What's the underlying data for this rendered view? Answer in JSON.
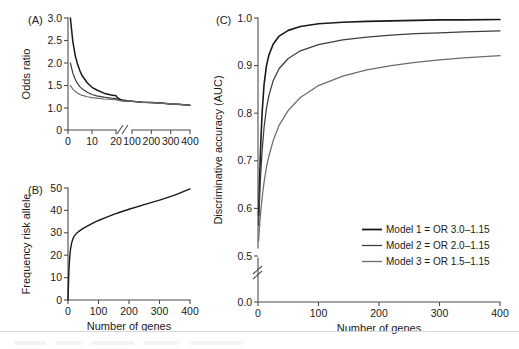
{
  "figure": {
    "panels": [
      "A",
      "B",
      "C"
    ],
    "shared_xlabel": "Number of genes"
  },
  "chart_data": [
    {
      "id": "panelA",
      "type": "line",
      "panel_letter": "(A)",
      "title": "",
      "xlabel": "Number of genes",
      "ylabel": "Odds ratio",
      "xlim": [
        0,
        400
      ],
      "ylim": [
        0,
        3.0
      ],
      "x_axis_break": true,
      "x_break_between": [
        20,
        100
      ],
      "y_axis_break": true,
      "y_break_between": [
        0,
        1.0
      ],
      "xticks": [
        0,
        10,
        20,
        100,
        200,
        300,
        400
      ],
      "xticklabels": [
        "0",
        "10",
        "20",
        "100",
        "200",
        "300",
        "400"
      ],
      "yticks": [
        0,
        1.0,
        1.5,
        2.0,
        2.5,
        3.0
      ],
      "yticklabels": [
        "0",
        "1.0",
        "1.5",
        "2.0",
        "2.5",
        "3.0"
      ],
      "grid": false,
      "legend": "none",
      "series": [
        {
          "name": "Model 1 = OR 3.0-1.15",
          "color": "#1a1a1a",
          "start_or": 3.0,
          "end_or": 1.15,
          "x": [
            1,
            2,
            3,
            4,
            5,
            6,
            8,
            10,
            12,
            15,
            18,
            20,
            25,
            30,
            40,
            50,
            75,
            100,
            150,
            200,
            250,
            300,
            350,
            400
          ],
          "values": [
            3.0,
            2.48,
            2.17,
            1.97,
            1.82,
            1.71,
            1.56,
            1.46,
            1.4,
            1.33,
            1.29,
            1.27,
            1.23,
            1.21,
            1.19,
            1.18,
            1.16,
            1.15,
            1.13,
            1.12,
            1.11,
            1.09,
            1.08,
            1.06
          ]
        },
        {
          "name": "Model 2 = OR 2.0-1.15",
          "color": "#3d3d3d",
          "start_or": 2.0,
          "end_or": 1.15,
          "x": [
            1,
            2,
            3,
            4,
            5,
            6,
            8,
            10,
            12,
            15,
            18,
            20,
            25,
            30,
            40,
            50,
            75,
            100,
            150,
            200,
            250,
            300,
            350,
            400
          ],
          "values": [
            2.0,
            1.78,
            1.64,
            1.54,
            1.47,
            1.42,
            1.35,
            1.3,
            1.27,
            1.24,
            1.22,
            1.21,
            1.19,
            1.18,
            1.17,
            1.16,
            1.15,
            1.15,
            1.13,
            1.12,
            1.11,
            1.09,
            1.08,
            1.06
          ]
        },
        {
          "name": "Model 3 = OR 1.5-1.15",
          "color": "#6b6b6b",
          "start_or": 1.5,
          "end_or": 1.15,
          "x": [
            1,
            2,
            3,
            4,
            5,
            6,
            8,
            10,
            12,
            15,
            18,
            20,
            25,
            30,
            40,
            50,
            75,
            100,
            150,
            200,
            250,
            300,
            350,
            400
          ],
          "values": [
            1.5,
            1.42,
            1.37,
            1.33,
            1.3,
            1.28,
            1.25,
            1.23,
            1.22,
            1.2,
            1.19,
            1.185,
            1.175,
            1.17,
            1.165,
            1.16,
            1.155,
            1.15,
            1.13,
            1.12,
            1.11,
            1.09,
            1.08,
            1.06
          ]
        }
      ]
    },
    {
      "id": "panelB",
      "type": "line",
      "panel_letter": "(B)",
      "title": "",
      "xlabel": "Number of genes",
      "ylabel": "Frequency risk allele",
      "xlim": [
        0,
        400
      ],
      "ylim": [
        0,
        50
      ],
      "x_axis_break": false,
      "y_axis_break": false,
      "xticks": [
        0,
        100,
        200,
        300,
        400
      ],
      "xticklabels": [
        "0",
        "100",
        "200",
        "300",
        "400"
      ],
      "yticks": [
        0,
        10,
        20,
        30,
        40,
        50
      ],
      "yticklabels": [
        "0",
        "10",
        "20",
        "30",
        "40",
        "50"
      ],
      "grid": false,
      "legend": "none",
      "series": [
        {
          "name": "Frequency risk allele",
          "color": "#1a1a1a",
          "x": [
            1,
            2,
            3,
            5,
            8,
            12,
            16,
            20,
            25,
            30,
            40,
            50,
            60,
            80,
            100,
            125,
            150,
            175,
            200,
            250,
            300,
            350,
            400
          ],
          "values": [
            4.5,
            9.0,
            13.0,
            18.0,
            22.5,
            25.5,
            27.2,
            28.4,
            29.3,
            30.0,
            31.1,
            32.0,
            32.8,
            34.2,
            35.5,
            36.9,
            38.2,
            39.4,
            40.5,
            42.6,
            44.6,
            46.8,
            49.6
          ]
        }
      ]
    },
    {
      "id": "panelC",
      "type": "line",
      "panel_letter": "(C)",
      "title": "",
      "xlabel": "Number of genes",
      "ylabel": "Discriminative accuracy (AUC)",
      "xlim": [
        0,
        400
      ],
      "ylim": [
        0.5,
        1.0
      ],
      "x_axis_break": false,
      "y_axis_break": true,
      "y_break_between": [
        0.0,
        0.5
      ],
      "xticks": [
        0,
        100,
        200,
        300,
        400
      ],
      "xticklabels": [
        "0",
        "100",
        "200",
        "300",
        "400"
      ],
      "yticks": [
        0.0,
        0.5,
        0.6,
        0.7,
        0.8,
        0.9,
        1.0
      ],
      "yticklabels": [
        "0.0",
        "0.5",
        "0.6",
        "0.7",
        "0.8",
        "0.9",
        "1.0"
      ],
      "grid": false,
      "legend": "inside-lower-right",
      "series": [
        {
          "name": "Model 1 = OR 3.0-1.15",
          "color": "#1a1a1a",
          "x": [
            1,
            2,
            3,
            4,
            5,
            7,
            10,
            14,
            18,
            25,
            35,
            50,
            70,
            100,
            140,
            180,
            220,
            260,
            300,
            340,
            400
          ],
          "values": [
            0.585,
            0.63,
            0.675,
            0.715,
            0.75,
            0.805,
            0.86,
            0.9,
            0.922,
            0.945,
            0.962,
            0.974,
            0.982,
            0.988,
            0.991,
            0.993,
            0.994,
            0.995,
            0.996,
            0.996,
            0.997
          ]
        },
        {
          "name": "Model 2 = OR 2.0-1.15",
          "color": "#3d3d3d",
          "x": [
            1,
            2,
            3,
            4,
            5,
            7,
            10,
            14,
            18,
            25,
            35,
            50,
            70,
            100,
            140,
            180,
            220,
            260,
            300,
            340,
            400
          ],
          "values": [
            0.565,
            0.6,
            0.632,
            0.66,
            0.684,
            0.724,
            0.77,
            0.81,
            0.837,
            0.868,
            0.894,
            0.915,
            0.931,
            0.944,
            0.954,
            0.96,
            0.964,
            0.967,
            0.969,
            0.971,
            0.973
          ]
        },
        {
          "name": "Model 3 = OR 1.5-1.15",
          "color": "#6b6b6b",
          "x": [
            1,
            2,
            3,
            4,
            5,
            7,
            10,
            14,
            18,
            25,
            35,
            50,
            70,
            100,
            140,
            180,
            220,
            260,
            300,
            340,
            400
          ],
          "values": [
            0.532,
            0.552,
            0.57,
            0.586,
            0.6,
            0.625,
            0.655,
            0.687,
            0.71,
            0.742,
            0.775,
            0.806,
            0.833,
            0.858,
            0.878,
            0.891,
            0.9,
            0.907,
            0.912,
            0.916,
            0.921
          ]
        }
      ],
      "legend_entries": [
        {
          "label": "Model 1 = OR 3.0–1.15",
          "color": "#1a1a1a"
        },
        {
          "label": "Model 2 = OR 2.0–1.15",
          "color": "#3d3d3d"
        },
        {
          "label": "Model 3 = OR 1.5–1.15",
          "color": "#6b6b6b"
        }
      ]
    }
  ]
}
